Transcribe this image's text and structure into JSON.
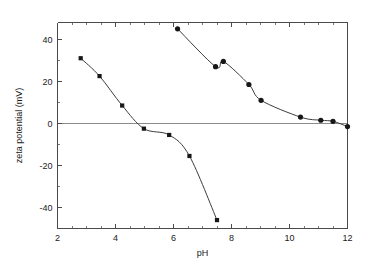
{
  "chart_data": {
    "type": "scatter",
    "title": "",
    "xlabel": "pH",
    "ylabel": "zeta potential (mV)",
    "xlim": [
      2,
      12
    ],
    "ylim": [
      -50,
      48
    ],
    "xticks": [
      2,
      4,
      6,
      8,
      10,
      12
    ],
    "xtick_labels": [
      "2",
      "4",
      "6",
      "8",
      "10",
      "12"
    ],
    "yticks": [
      -40,
      -20,
      0,
      20,
      40
    ],
    "ytick_labels": [
      "-40",
      "-20",
      "0",
      "20",
      "40"
    ],
    "x_minor_step": 0.5,
    "y_minor_step": 10,
    "grid": false,
    "legend": "none",
    "zero_reference_line": 0,
    "series": [
      {
        "name": "series-squares",
        "marker": "square",
        "marker_size": 4.2,
        "color": "#171717",
        "line_color": "#3c3c3c",
        "connected": true,
        "points": [
          {
            "x": 2.8,
            "y": 31.0
          },
          {
            "x": 3.45,
            "y": 22.5
          },
          {
            "x": 4.23,
            "y": 8.5
          },
          {
            "x": 4.98,
            "y": -2.5
          },
          {
            "x": 5.85,
            "y": -5.5
          },
          {
            "x": 6.55,
            "y": -15.5
          },
          {
            "x": 7.5,
            "y": -46.0
          }
        ]
      },
      {
        "name": "series-circles",
        "marker": "circle",
        "marker_size": 2.6,
        "color": "#171717",
        "line_color": "#3c3c3c",
        "connected": true,
        "points": [
          {
            "x": 6.14,
            "y": 45.0
          },
          {
            "x": 7.45,
            "y": 27.0
          },
          {
            "x": 7.72,
            "y": 29.5
          },
          {
            "x": 8.6,
            "y": 18.5
          },
          {
            "x": 9.02,
            "y": 11.0
          },
          {
            "x": 10.38,
            "y": 3.0
          },
          {
            "x": 11.08,
            "y": 1.5
          },
          {
            "x": 11.5,
            "y": 1.0
          },
          {
            "x": 12.0,
            "y": -1.5
          }
        ]
      }
    ]
  },
  "caption": {
    "partial_text": " "
  }
}
